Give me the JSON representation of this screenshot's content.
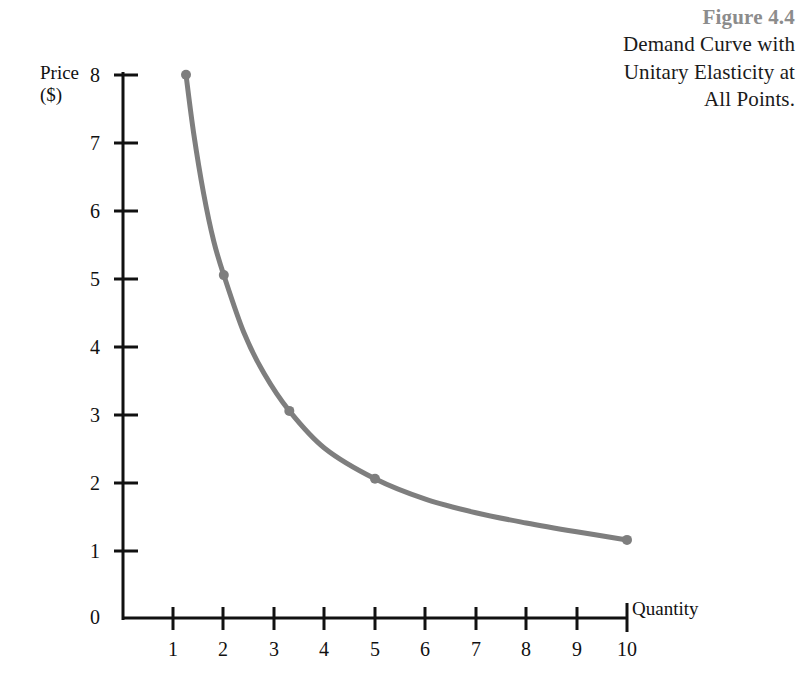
{
  "figure": {
    "number": "Figure 4.4",
    "title_lines": [
      "Demand Curve with",
      "Unitary Elasticity at",
      "All Points."
    ],
    "number_color": "#8c8c8c",
    "title_color": "#1a1a1a"
  },
  "axes": {
    "y_label_line1": "Price",
    "y_label_line2": "($)",
    "x_label": "Quantity",
    "y_ticks": [
      "8",
      "7",
      "6",
      "5",
      "4",
      "3",
      "2",
      "1",
      "0"
    ],
    "x_ticks": [
      "1",
      "2",
      "3",
      "4",
      "5",
      "6",
      "7",
      "8",
      "9",
      "10"
    ],
    "axis_color": "#111111"
  },
  "chart_data": {
    "type": "line",
    "title": "Demand Curve with Unitary Elasticity at All Points.",
    "subtitle": "Figure 4.4",
    "xlabel": "Quantity",
    "ylabel": "Price ($)",
    "xlim": [
      0,
      10.4
    ],
    "ylim": [
      0,
      8.4
    ],
    "xticks": [
      1,
      2,
      3,
      4,
      5,
      6,
      7,
      8,
      9,
      10
    ],
    "yticks": [
      0,
      1,
      2,
      3,
      4,
      5,
      6,
      7,
      8
    ],
    "grid": false,
    "legend": "none",
    "curve_color": "#7e7e7e",
    "curve_width": 5,
    "marker": "circle",
    "marker_size": 8,
    "relationship": "P x Q = 10 (constant total revenue, unitary elasticity)",
    "series": [
      {
        "name": "Demand",
        "points": [
          {
            "x": 1.25,
            "y": 8.0
          },
          {
            "x": 2.0,
            "y": 5.05
          },
          {
            "x": 3.3,
            "y": 3.05
          },
          {
            "x": 5.0,
            "y": 2.05
          },
          {
            "x": 10.0,
            "y": 1.15
          }
        ]
      }
    ],
    "curve_samples": [
      {
        "x": 1.25,
        "y": 8.0
      },
      {
        "x": 1.4,
        "y": 7.15
      },
      {
        "x": 1.6,
        "y": 6.25
      },
      {
        "x": 1.8,
        "y": 5.55
      },
      {
        "x": 2.0,
        "y": 5.05
      },
      {
        "x": 2.4,
        "y": 4.2
      },
      {
        "x": 2.8,
        "y": 3.6
      },
      {
        "x": 3.3,
        "y": 3.05
      },
      {
        "x": 4.0,
        "y": 2.5
      },
      {
        "x": 5.0,
        "y": 2.05
      },
      {
        "x": 6.0,
        "y": 1.75
      },
      {
        "x": 7.0,
        "y": 1.55
      },
      {
        "x": 8.0,
        "y": 1.4
      },
      {
        "x": 9.0,
        "y": 1.27
      },
      {
        "x": 10.0,
        "y": 1.15
      }
    ]
  }
}
